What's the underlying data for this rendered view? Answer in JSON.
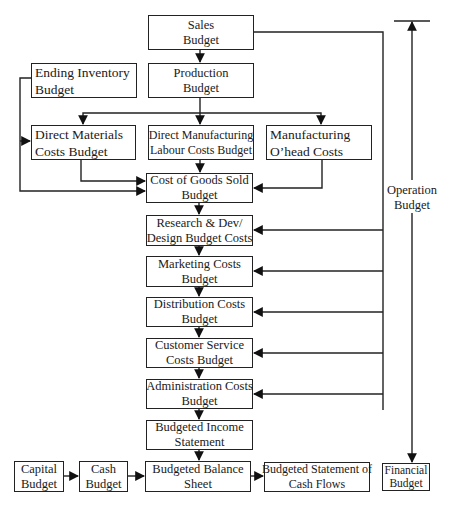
{
  "diagram": {
    "type": "budget-flowchart",
    "nodes": {
      "sales": {
        "line1": "Sales",
        "line2": "Budget"
      },
      "production": {
        "line1": "Production",
        "line2": "Budget"
      },
      "ending_inventory": {
        "line1": "Ending Inventory",
        "line2": "Budget"
      },
      "direct_materials": {
        "line1": "Direct Materials",
        "line2": "Costs Budget"
      },
      "direct_labour": {
        "line1": "Direct Manufacturing",
        "line2": "Labour Costs Budget"
      },
      "manufacturing_overhead": {
        "line1": "Manufacturing",
        "line2": "O’head Costs"
      },
      "cogs": {
        "line1": "Cost of Goods Sold",
        "line2": "Budget"
      },
      "research_dev": {
        "line1": "Research & Dev/",
        "line2": "Design Budget Costs"
      },
      "marketing": {
        "line1": "Marketing Costs",
        "line2": "Budget"
      },
      "distribution": {
        "line1": "Distribution Costs",
        "line2": "Budget"
      },
      "customer_service": {
        "line1": "Customer Service",
        "line2": "Costs Budget"
      },
      "administration": {
        "line1": "Administration Costs",
        "line2": "Budget"
      },
      "income_statement": {
        "line1": "Budgeted Income",
        "line2": "Statement"
      },
      "capital": {
        "line1": "Capital",
        "line2": "Budget"
      },
      "cash": {
        "line1": "Cash",
        "line2": "Budget"
      },
      "balance_sheet": {
        "line1": "Budgeted Balance",
        "line2": "Sheet"
      },
      "cash_flows": {
        "line1": "Budgeted Statement of",
        "line2": "Cash Flows"
      },
      "financial": {
        "line1": "Financial",
        "line2": "Budget"
      }
    },
    "bracket_label": {
      "line1": "Operation",
      "line2": "Budget"
    },
    "edges": [
      [
        "sales",
        "production"
      ],
      [
        "production",
        "direct_materials"
      ],
      [
        "production",
        "direct_labour"
      ],
      [
        "production",
        "manufacturing_overhead"
      ],
      [
        "ending_inventory",
        "direct_materials"
      ],
      [
        "ending_inventory",
        "cogs"
      ],
      [
        "direct_materials",
        "cogs"
      ],
      [
        "direct_labour",
        "cogs"
      ],
      [
        "manufacturing_overhead",
        "cogs"
      ],
      [
        "cogs",
        "research_dev"
      ],
      [
        "research_dev",
        "marketing"
      ],
      [
        "marketing",
        "distribution"
      ],
      [
        "distribution",
        "customer_service"
      ],
      [
        "customer_service",
        "administration"
      ],
      [
        "administration",
        "income_statement"
      ],
      [
        "income_statement",
        "balance_sheet"
      ],
      [
        "sales",
        "research_dev"
      ],
      [
        "sales",
        "marketing"
      ],
      [
        "sales",
        "distribution"
      ],
      [
        "sales",
        "customer_service"
      ],
      [
        "sales",
        "administration"
      ],
      [
        "capital",
        "cash"
      ],
      [
        "cash",
        "balance_sheet"
      ],
      [
        "balance_sheet",
        "cash_flows"
      ]
    ]
  }
}
